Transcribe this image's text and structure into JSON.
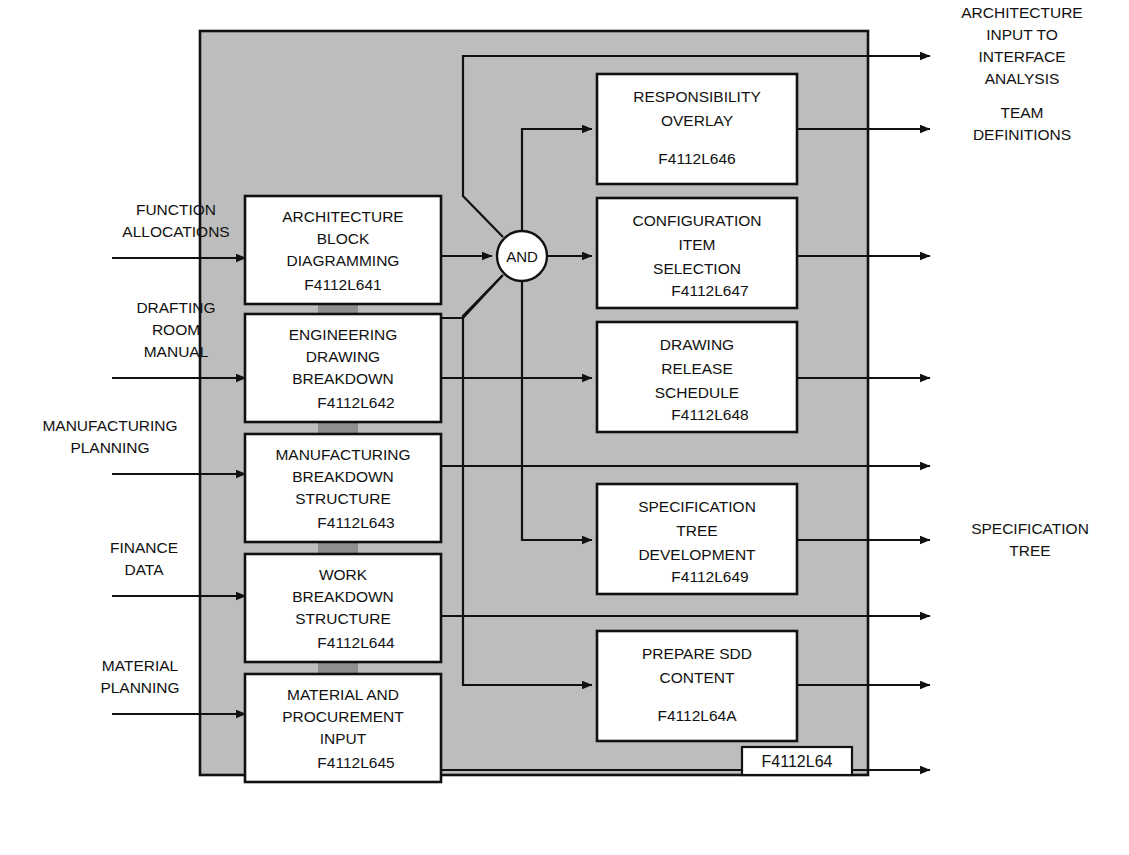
{
  "diagram": {
    "title_tag": "F4112L64",
    "gate_label": "AND",
    "colors": {
      "panel_fill": "#bdbdbd",
      "box_fill": "#ffffff",
      "line": "#111111",
      "tab_fill": "#8f8f8f",
      "background": "#ffffff"
    },
    "inputs": [
      {
        "id": "in1",
        "lines": [
          "FUNCTION",
          "ALLOCATIONS"
        ]
      },
      {
        "id": "in2",
        "lines": [
          "DRAFTING",
          "ROOM",
          "MANUAL"
        ]
      },
      {
        "id": "in3",
        "lines": [
          "MANUFACTURING",
          "PLANNING"
        ]
      },
      {
        "id": "in4",
        "lines": [
          "FINANCE",
          "DATA"
        ]
      },
      {
        "id": "in5",
        "lines": [
          "MATERIAL",
          "PLANNING"
        ]
      }
    ],
    "left_boxes": [
      {
        "id": "L641",
        "lines": [
          "ARCHITECTURE",
          "BLOCK",
          "DIAGRAMMING"
        ],
        "code": "F4112L641"
      },
      {
        "id": "L642",
        "lines": [
          "ENGINEERING",
          "DRAWING",
          "BREAKDOWN"
        ],
        "code": "F4112L642"
      },
      {
        "id": "L643",
        "lines": [
          "MANUFACTURING",
          "BREAKDOWN",
          "STRUCTURE"
        ],
        "code": "F4112L643"
      },
      {
        "id": "L644",
        "lines": [
          "WORK",
          "BREAKDOWN",
          "STRUCTURE"
        ],
        "code": "F4112L644"
      },
      {
        "id": "L645",
        "lines": [
          "MATERIAL AND",
          "PROCUREMENT",
          "INPUT"
        ],
        "code": "F4112L645"
      }
    ],
    "right_boxes": [
      {
        "id": "L646",
        "lines": [
          "RESPONSIBILITY",
          "OVERLAY"
        ],
        "code": "F4112L646"
      },
      {
        "id": "L647",
        "lines": [
          "CONFIGURATION",
          "ITEM",
          "SELECTION"
        ],
        "code": "F4112L647"
      },
      {
        "id": "L648",
        "lines": [
          "DRAWING",
          "RELEASE",
          "SCHEDULE"
        ],
        "code": "F4112L648"
      },
      {
        "id": "L649",
        "lines": [
          "SPECIFICATION",
          "TREE",
          "DEVELOPMENT"
        ],
        "code": "F4112L649"
      },
      {
        "id": "L64A",
        "lines": [
          "PREPARE SDD",
          "CONTENT"
        ],
        "code": "F4112L64A"
      }
    ],
    "outputs": [
      {
        "id": "out1",
        "lines": [
          "ARCHITECTURE",
          "INPUT TO",
          "INTERFACE",
          "ANALYSIS"
        ]
      },
      {
        "id": "out2",
        "lines": [
          "TEAM",
          "DEFINITIONS"
        ]
      },
      {
        "id": "out3",
        "lines": []
      },
      {
        "id": "out4",
        "lines": []
      },
      {
        "id": "out5",
        "lines": []
      },
      {
        "id": "out6",
        "lines": [
          "SPECIFICATION",
          "TREE"
        ]
      },
      {
        "id": "out7",
        "lines": []
      },
      {
        "id": "out8",
        "lines": []
      },
      {
        "id": "out9",
        "lines": []
      }
    ]
  }
}
